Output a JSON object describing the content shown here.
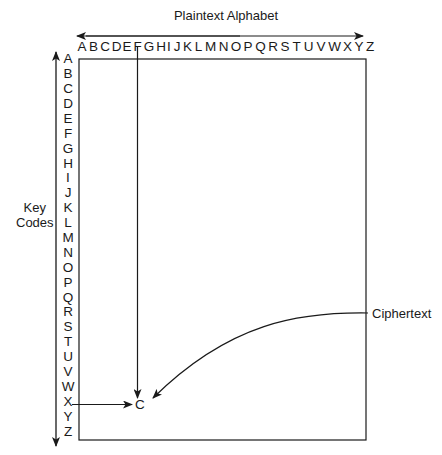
{
  "diagram": {
    "title": "Plaintext Alphabet",
    "row_axis_label_line1": "Key",
    "row_axis_label_line2": "Codes",
    "output_label": "Ciphertext",
    "result_letter": "C",
    "plaintext_letter": "F",
    "key_letter": "X",
    "columns": [
      "A",
      "B",
      "C",
      "D",
      "E",
      "F",
      "G",
      "H",
      "I",
      "J",
      "K",
      "L",
      "M",
      "N",
      "O",
      "P",
      "Q",
      "R",
      "S",
      "T",
      "U",
      "V",
      "W",
      "X",
      "Y",
      "Z"
    ],
    "rows": [
      "A",
      "B",
      "C",
      "D",
      "E",
      "F",
      "G",
      "H",
      "I",
      "J",
      "K",
      "L",
      "M",
      "N",
      "O",
      "P",
      "Q",
      "R",
      "S",
      "T",
      "U",
      "V",
      "W",
      "X",
      "Y",
      "Z"
    ],
    "colors": {
      "line": "#1a1a1a",
      "background": "#ffffff"
    }
  }
}
